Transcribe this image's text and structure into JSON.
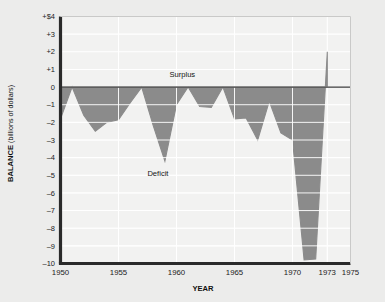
{
  "chart_data": {
    "type": "area",
    "title": "",
    "xlabel": "YEAR",
    "ylabel": "BALANCE",
    "ylabel_units": "(billions of dollars)",
    "xlim": [
      1950,
      1975
    ],
    "ylim": [
      -10,
      4
    ],
    "grid": true,
    "legend": "none",
    "y_ticks": [
      4,
      3,
      2,
      1,
      0,
      -1,
      -2,
      -3,
      -4,
      -5,
      -6,
      -7,
      -8,
      -9,
      -10
    ],
    "y_tick_labels": [
      "+$4",
      "+3",
      "+2",
      "+1",
      "0",
      "–1",
      "–2",
      "–3",
      "–4",
      "–5",
      "–6",
      "–7",
      "–8",
      "–9",
      "–10"
    ],
    "x_ticks": [
      1950,
      1955,
      1960,
      1965,
      1970,
      1973,
      1975
    ],
    "x_tick_labels": [
      "1950",
      "1955",
      "1960",
      "1965",
      "1970",
      "1973",
      "1975"
    ],
    "zero_line": 0,
    "annotations": [
      {
        "text": "Surplus",
        "x": 1960.5,
        "y": 0.55
      },
      {
        "text": "Deficit",
        "x": 1958.4,
        "y": -5.05
      }
    ],
    "colors": {
      "fill": "#8b8b8b",
      "plot_background": "#f2f2f1",
      "gridline": "#ffffff",
      "axis": "#2a2a2a",
      "page_background": "#ececeb"
    },
    "x": [
      1950,
      1951,
      1952,
      1953,
      1954,
      1955,
      1956,
      1957,
      1958,
      1959,
      1960,
      1961,
      1962,
      1963,
      1964,
      1965,
      1966,
      1967,
      1968,
      1969,
      1970,
      1971,
      1972,
      1973
    ],
    "values": [
      -1.8,
      0.0,
      -1.6,
      -2.5,
      -2.0,
      -1.85,
      -0.9,
      0.0,
      -2.2,
      -4.2,
      -1.0,
      0.0,
      -1.1,
      -1.15,
      0.0,
      -1.8,
      -1.75,
      -3.0,
      -0.8,
      -2.6,
      -3.0,
      -9.8,
      -9.75,
      2.0
    ],
    "series_name": "Balance"
  },
  "axis_labels": {
    "y_title_bold": "BALANCE",
    "y_title_rest": " (billions of dollars)",
    "x_title": "YEAR"
  }
}
